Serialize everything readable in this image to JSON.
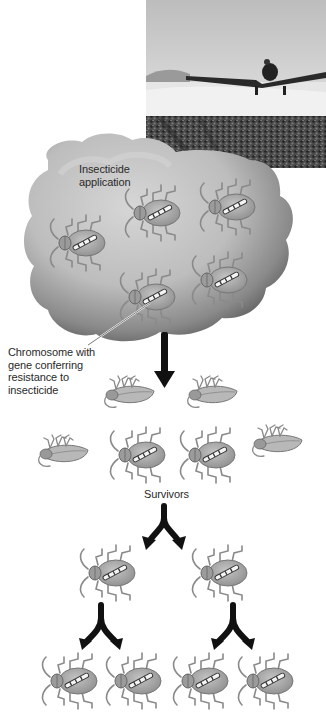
{
  "diagram": {
    "photo": {
      "subject": "crop-duster airplane spraying field",
      "style": "grayscale"
    },
    "stages": [
      {
        "name": "application",
        "label": "Insecticide application",
        "insects_alive": 5
      },
      {
        "name": "after-spraying",
        "insects_dead": 4,
        "insects_alive": 2
      },
      {
        "name": "survivors",
        "label": "Survivors",
        "insects": 2
      },
      {
        "name": "offspring",
        "insects": 4
      }
    ],
    "labels": {
      "cloud_line1": "Insecticide",
      "cloud_line2": "application",
      "chromosome_line1": "Chromosome with",
      "chromosome_line2": "gene conferring",
      "chromosome_line3": "resistance to",
      "chromosome_line4": "insecticide",
      "survivors": "Survivors"
    },
    "colors": {
      "cloud_light": "#c8c8c8",
      "cloud_dark": "#6e6e6e",
      "beetle_body": "#a9a9a9",
      "arrow": "#111111",
      "text": "#2a2a2a"
    }
  }
}
